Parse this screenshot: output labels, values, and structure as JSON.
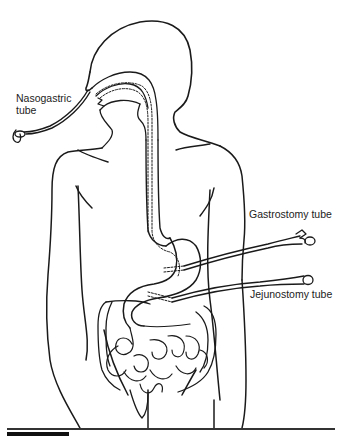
{
  "figure": {
    "line_color": "#1a1a1a",
    "background": "#ffffff"
  },
  "labels": {
    "nasogastric": "Nasogastric tube",
    "gastrostomy": "Gastrostomy tube",
    "jejunostomy": "Jejunostomy tube"
  },
  "icons": {
    "ng_connector": "tube-connector-icon",
    "g_connector": "tube-connector-icon",
    "j_connector": "tube-connector-icon"
  }
}
